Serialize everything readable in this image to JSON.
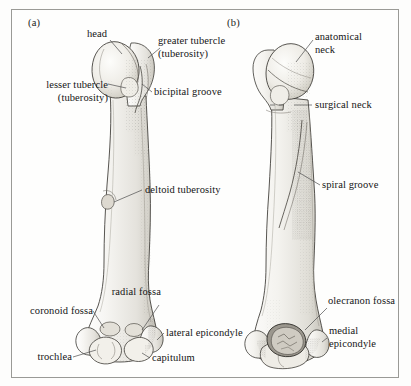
{
  "figure": {
    "border_color": "#9a9a96",
    "background_color": "#fefefd",
    "ink_color": "#151515"
  },
  "panels": [
    {
      "tag": "(a)",
      "view": "anterior",
      "labels": [
        {
          "key": "head",
          "text": "head",
          "align": "center"
        },
        {
          "key": "greater_tubercle",
          "text": "greater tubercle\n(tuberosity)",
          "align": "left"
        },
        {
          "key": "lesser_tubercle",
          "text": "lesser tubercle\n(tuberosity)",
          "align": "right"
        },
        {
          "key": "bicipital_groove",
          "text": "bicipital groove",
          "align": "left"
        },
        {
          "key": "deltoid_tuberosity",
          "text": "deltoid tuberosity",
          "align": "left"
        },
        {
          "key": "radial_fossa",
          "text": "radial fossa",
          "align": "right"
        },
        {
          "key": "coronoid_fossa",
          "text": "coronoid fossa",
          "align": "right"
        },
        {
          "key": "lateral_epicondyle",
          "text": "lateral epicondyle",
          "align": "left"
        },
        {
          "key": "trochlea",
          "text": "trochlea",
          "align": "right"
        },
        {
          "key": "capitulum",
          "text": "capitulum",
          "align": "left"
        }
      ]
    },
    {
      "tag": "(b)",
      "view": "posterior",
      "labels": [
        {
          "key": "anatomical_neck",
          "text": "anatomical\nneck",
          "align": "left"
        },
        {
          "key": "surgical_neck",
          "text": "surgical neck",
          "align": "left"
        },
        {
          "key": "spiral_groove",
          "text": "spiral groove",
          "align": "left"
        },
        {
          "key": "olecranon_fossa",
          "text": "olecranon fossa",
          "align": "left"
        },
        {
          "key": "medial_epicondyle",
          "text": "medial\nepicondyle",
          "align": "left"
        }
      ]
    }
  ]
}
